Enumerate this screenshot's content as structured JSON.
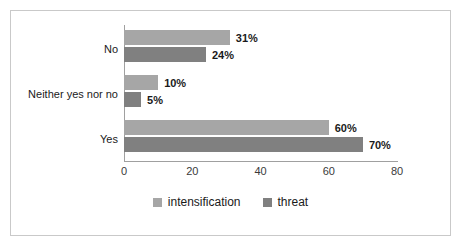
{
  "chart_data": {
    "type": "bar",
    "orientation": "horizontal",
    "title": "",
    "subtitle": "",
    "xlabel": "",
    "ylabel": "",
    "categories": [
      "No",
      "Neither yes nor no",
      "Yes"
    ],
    "series": [
      {
        "name": "intensification",
        "color": "#a6a6a6",
        "values": [
          31,
          10,
          60
        ],
        "labels": [
          "31%",
          "10%",
          "60%"
        ]
      },
      {
        "name": "threat",
        "color": "#808080",
        "values": [
          24,
          5,
          70
        ],
        "labels": [
          "24%",
          "5%",
          "70%"
        ]
      }
    ],
    "xlim": [
      0,
      80
    ],
    "xticks": [
      0,
      20,
      40,
      60,
      80
    ],
    "xtick_labels": [
      "0",
      "20",
      "40",
      "60",
      "80"
    ],
    "grid": false,
    "legend_position": "bottom",
    "legend": [
      "intensification",
      "threat"
    ]
  },
  "style": {
    "frame_color": "#c9c9c9",
    "axis_color": "#a0a0a0",
    "text_color": "#1a1a1a",
    "background": "#ffffff"
  }
}
